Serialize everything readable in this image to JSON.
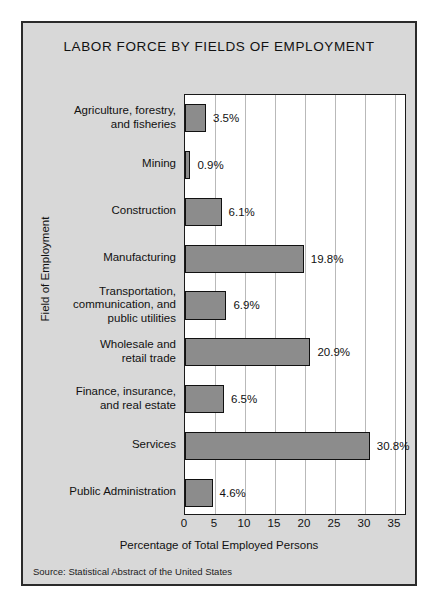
{
  "figure": {
    "title": "LABOR FORCE BY FIELDS OF EMPLOYMENT",
    "source": "Source: Statistical Abstract of the United States",
    "panel_color": "#d8d8d8",
    "bar_color": "#8c8c8c",
    "plot_background": "#ffffff",
    "gridline_color": "#b9b9b9",
    "border_color": "#2b2b2b"
  },
  "chart_data": {
    "type": "bar",
    "orientation": "horizontal",
    "title": "LABOR FORCE BY FIELDS OF EMPLOYMENT",
    "xlabel": "Percentage of Total Employed Persons",
    "ylabel": "Field of Employment",
    "categories": [
      "Agriculture, forestry, and fisheries",
      "Mining",
      "Construction",
      "Manufacturing",
      "Transportation, communication, and public utilities",
      "Wholesale and retail trade",
      "Finance, insurance, and real estate",
      "Services",
      "Public Administration"
    ],
    "category_label_lines": [
      [
        "Agriculture, forestry,",
        "and fisheries"
      ],
      [
        "Mining"
      ],
      [
        "Construction"
      ],
      [
        "Manufacturing"
      ],
      [
        "Transportation,",
        "communication, and",
        "public utilities"
      ],
      [
        "Wholesale and",
        "retail trade"
      ],
      [
        "Finance, insurance,",
        "and real estate"
      ],
      [
        "Services"
      ],
      [
        "Public Administration"
      ]
    ],
    "values": [
      3.5,
      0.9,
      6.1,
      19.8,
      6.9,
      20.9,
      6.5,
      30.8,
      4.6
    ],
    "value_labels": [
      "3.5%",
      "0.9%",
      "6.1%",
      "19.8%",
      "6.9%",
      "20.9%",
      "6.5%",
      "30.8%",
      "4.6%"
    ],
    "xlim": [
      0,
      37
    ],
    "xticks": [
      0,
      5,
      10,
      15,
      20,
      25,
      30,
      35
    ],
    "xtick_labels": [
      "0",
      "5",
      "10",
      "15",
      "20",
      "25",
      "30",
      "35"
    ],
    "grid": true,
    "grid_axis": "x",
    "legend": false
  }
}
